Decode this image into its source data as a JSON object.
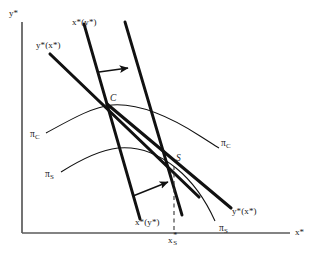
{
  "figure": {
    "background_color": "#ffffff",
    "ink_color": "#111111",
    "axis_color": "#5a5a5a",
    "axes": {
      "y_axis_label": "y*",
      "x_axis_label": "x*",
      "origin": [
        22,
        233
      ],
      "y_axis_top": [
        22,
        22
      ],
      "x_axis_right": [
        290,
        233
      ]
    },
    "points": [
      {
        "id": "C",
        "label": "C",
        "x": 107,
        "y": 104,
        "meaning": "cournot-equilibrium"
      },
      {
        "id": "S",
        "label": "S",
        "x": 172,
        "y": 163,
        "meaning": "stackelberg-equilibrium"
      }
    ],
    "tick_labels": [
      {
        "id": "x-s-star",
        "base": "x",
        "superscript": "*",
        "subscript": "S",
        "x": 169,
        "y": 240
      }
    ],
    "curve_labels": [
      {
        "id": "xy-top",
        "text": "x*(y*)",
        "x": 72,
        "y": 22
      },
      {
        "id": "yx-top",
        "text": "y*(x*)",
        "x": 36,
        "y": 45
      },
      {
        "id": "xy-bottom",
        "text": "x*(y*)",
        "x": 135,
        "y": 222
      },
      {
        "id": "yx-bottom",
        "text": "y*(x*)",
        "x": 232,
        "y": 211
      },
      {
        "id": "pi-c-left",
        "text": "π",
        "sub": "C",
        "x": 33,
        "y": 135
      },
      {
        "id": "pi-c-right",
        "text": "π",
        "sub": "C",
        "x": 223,
        "y": 144
      },
      {
        "id": "pi-s-left",
        "text": "π",
        "sub": "S",
        "x": 48,
        "y": 175
      },
      {
        "id": "pi-s-right",
        "text": "π",
        "sub": "S",
        "x": 222,
        "y": 228
      }
    ],
    "arrows": [
      {
        "id": "shift-arrow-upper",
        "from": [
          100,
          72
        ],
        "to": [
          130,
          68
        ],
        "direction": "right"
      },
      {
        "id": "shift-arrow-lower",
        "from": [
          133,
          196
        ],
        "to": [
          170,
          181
        ],
        "direction": "up-right"
      }
    ],
    "reaction_lines": [
      {
        "id": "x-of-y-original",
        "label": "x*(y*)",
        "weight": "thick",
        "from": [
          84,
          24
        ],
        "to": [
          140,
          219
        ]
      },
      {
        "id": "x-of-y-shifted",
        "label": "x*(y*)",
        "weight": "thick",
        "from": [
          125,
          22
        ],
        "to": [
          182,
          215
        ]
      },
      {
        "id": "y-of-x-through-c",
        "label": "y*(x*)",
        "weight": "thick",
        "from": [
          50,
          54
        ],
        "to": [
          208,
          205
        ]
      },
      {
        "id": "y-of-x-through-s",
        "label": "y*(x*)",
        "weight": "thick",
        "from": [
          107,
          104
        ],
        "to": [
          230,
          207
        ]
      }
    ],
    "isoprofit_curves": [
      {
        "id": "pi-c-curve",
        "label": "π_C",
        "weight": "thin",
        "through_point": "C"
      },
      {
        "id": "pi-s-curve",
        "label": "π_S",
        "weight": "thin",
        "through_point": "S"
      }
    ],
    "drop_line": {
      "id": "s-drop-line",
      "style": "dashed",
      "from": [
        172,
        163
      ],
      "to": [
        172,
        233
      ]
    }
  }
}
